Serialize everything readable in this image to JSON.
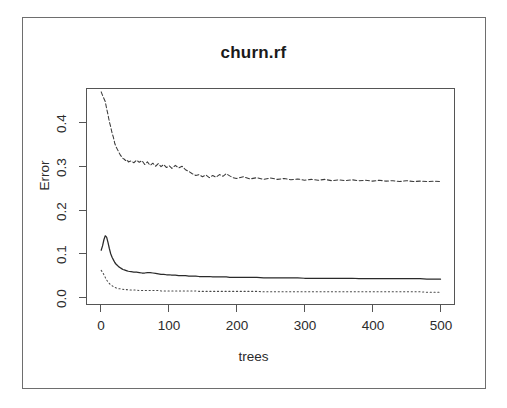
{
  "figure": {
    "title": "churn.rf",
    "background": "#ffffff",
    "frame_color": "#6e6e6e",
    "axis_color": "#555555"
  },
  "chart_data": {
    "type": "line",
    "title": "churn.rf",
    "xlabel": "trees",
    "ylabel": "Error",
    "xlim": [
      0,
      500
    ],
    "ylim": [
      0.0,
      0.47
    ],
    "xticks": [
      0,
      100,
      200,
      300,
      400,
      500
    ],
    "xtick_labels": [
      "0",
      "100",
      "200",
      "300",
      "400",
      "500"
    ],
    "yticks": [
      0.0,
      0.1,
      0.2,
      0.3,
      0.4
    ],
    "ytick_labels": [
      "0.0",
      "0.1",
      "0.2",
      "0.3",
      "0.4"
    ],
    "grid": false,
    "legend": null,
    "legend_position": "none",
    "x": [
      1,
      3,
      5,
      7,
      9,
      11,
      13,
      15,
      17,
      19,
      21,
      23,
      25,
      27,
      29,
      31,
      33,
      35,
      37,
      39,
      41,
      45,
      49,
      53,
      57,
      61,
      65,
      69,
      73,
      77,
      81,
      85,
      89,
      93,
      97,
      101,
      105,
      110,
      115,
      120,
      125,
      130,
      135,
      140,
      145,
      150,
      155,
      160,
      165,
      170,
      175,
      180,
      185,
      190,
      195,
      200,
      210,
      220,
      230,
      240,
      250,
      260,
      270,
      280,
      290,
      300,
      310,
      320,
      330,
      340,
      350,
      360,
      370,
      380,
      390,
      400,
      410,
      420,
      430,
      440,
      450,
      460,
      470,
      480,
      490,
      500
    ],
    "series": [
      {
        "name": "class-yes-error",
        "style": "dashed",
        "color": "#3a3a3a",
        "values": [
          0.47,
          0.462,
          0.455,
          0.448,
          0.432,
          0.418,
          0.402,
          0.39,
          0.376,
          0.366,
          0.352,
          0.344,
          0.338,
          0.332,
          0.326,
          0.322,
          0.318,
          0.316,
          0.313,
          0.315,
          0.31,
          0.312,
          0.308,
          0.314,
          0.309,
          0.313,
          0.304,
          0.31,
          0.302,
          0.307,
          0.3,
          0.306,
          0.299,
          0.304,
          0.297,
          0.301,
          0.295,
          0.302,
          0.296,
          0.3,
          0.292,
          0.288,
          0.283,
          0.279,
          0.281,
          0.276,
          0.28,
          0.274,
          0.279,
          0.275,
          0.281,
          0.277,
          0.283,
          0.278,
          0.274,
          0.272,
          0.276,
          0.271,
          0.274,
          0.27,
          0.273,
          0.27,
          0.272,
          0.269,
          0.271,
          0.268,
          0.27,
          0.268,
          0.27,
          0.267,
          0.269,
          0.267,
          0.269,
          0.267,
          0.268,
          0.266,
          0.268,
          0.266,
          0.267,
          0.265,
          0.267,
          0.265,
          0.266,
          0.265,
          0.266,
          0.265
        ]
      },
      {
        "name": "oob-error",
        "style": "solid",
        "color": "#2a2a2a",
        "values": [
          0.108,
          0.118,
          0.132,
          0.141,
          0.138,
          0.126,
          0.112,
          0.1,
          0.092,
          0.086,
          0.08,
          0.076,
          0.073,
          0.07,
          0.068,
          0.066,
          0.064,
          0.063,
          0.062,
          0.061,
          0.06,
          0.059,
          0.058,
          0.058,
          0.057,
          0.056,
          0.056,
          0.057,
          0.057,
          0.056,
          0.055,
          0.054,
          0.053,
          0.053,
          0.052,
          0.052,
          0.051,
          0.051,
          0.05,
          0.05,
          0.05,
          0.049,
          0.049,
          0.049,
          0.048,
          0.048,
          0.048,
          0.048,
          0.047,
          0.047,
          0.047,
          0.047,
          0.047,
          0.046,
          0.046,
          0.046,
          0.046,
          0.046,
          0.046,
          0.045,
          0.045,
          0.045,
          0.045,
          0.045,
          0.045,
          0.044,
          0.044,
          0.044,
          0.044,
          0.044,
          0.044,
          0.044,
          0.044,
          0.043,
          0.043,
          0.043,
          0.043,
          0.043,
          0.043,
          0.043,
          0.043,
          0.043,
          0.043,
          0.042,
          0.042,
          0.042
        ]
      },
      {
        "name": "class-no-error",
        "style": "dotted",
        "color": "#4a4a4a",
        "values": [
          0.062,
          0.058,
          0.052,
          0.046,
          0.04,
          0.036,
          0.032,
          0.029,
          0.027,
          0.025,
          0.023,
          0.022,
          0.021,
          0.02,
          0.02,
          0.019,
          0.019,
          0.018,
          0.018,
          0.018,
          0.017,
          0.017,
          0.017,
          0.017,
          0.016,
          0.016,
          0.016,
          0.016,
          0.016,
          0.016,
          0.016,
          0.016,
          0.015,
          0.015,
          0.015,
          0.015,
          0.015,
          0.015,
          0.015,
          0.015,
          0.015,
          0.015,
          0.015,
          0.015,
          0.014,
          0.014,
          0.014,
          0.014,
          0.014,
          0.014,
          0.014,
          0.014,
          0.014,
          0.014,
          0.014,
          0.014,
          0.014,
          0.014,
          0.014,
          0.013,
          0.013,
          0.013,
          0.013,
          0.013,
          0.013,
          0.013,
          0.013,
          0.013,
          0.013,
          0.013,
          0.013,
          0.013,
          0.013,
          0.013,
          0.013,
          0.013,
          0.013,
          0.013,
          0.013,
          0.013,
          0.013,
          0.013,
          0.013,
          0.012,
          0.012,
          0.012
        ]
      }
    ]
  }
}
